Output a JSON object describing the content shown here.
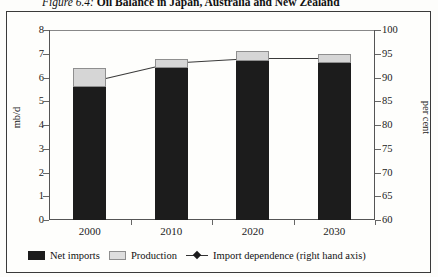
{
  "figure": {
    "number": "Figure 6.4:",
    "title": "Oil Balance in Japan, Australia and New Zealand"
  },
  "axes": {
    "left_title": "mb/d",
    "right_title": "per cent",
    "left_ticks": [
      "8",
      "7",
      "6",
      "5",
      "4",
      "3",
      "2",
      "1",
      "0"
    ],
    "right_ticks": [
      "100",
      "95",
      "90",
      "85",
      "80",
      "75",
      "70",
      "65",
      "60"
    ]
  },
  "legend": {
    "items": [
      {
        "label": "Net imports",
        "swatch": "black-filled-square",
        "color": "#1c1c1c"
      },
      {
        "label": "Production",
        "swatch": "light-grey-square",
        "color": "#dedede"
      },
      {
        "label": "Import dependence (right hand axis)",
        "swatch": "line-with-diamond-marker",
        "color": "#1c1c1c"
      }
    ]
  },
  "chart_data": {
    "type": "bar",
    "title": "Oil Balance in Japan, Australia and New Zealand",
    "categories": [
      "2000",
      "2010",
      "2020",
      "2030"
    ],
    "series": [
      {
        "name": "Net imports",
        "axis": "left",
        "values": [
          5.6,
          6.4,
          6.7,
          6.6
        ]
      },
      {
        "name": "Production",
        "axis": "left",
        "values": [
          0.8,
          0.4,
          0.4,
          0.4
        ]
      },
      {
        "name": "Import dependence (right hand axis)",
        "axis": "right",
        "values": [
          89,
          93,
          94,
          94
        ]
      }
    ],
    "stacked": true,
    "xlabel": "",
    "ylabel": "mb/d",
    "ylim": [
      0,
      8
    ],
    "y2label": "per cent",
    "y2lim": [
      60,
      100
    ],
    "grid": false,
    "legend_position": "bottom"
  }
}
